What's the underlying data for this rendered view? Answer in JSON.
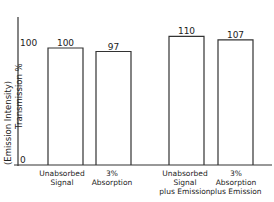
{
  "chart_data": {
    "type": "bar",
    "title": "",
    "xlabel": "",
    "ylabel": "Transmission %",
    "ylabel2": "(Emission Intensity)",
    "ylim": [
      0,
      115
    ],
    "yticks": [
      0,
      100
    ],
    "categories": [
      [
        "Unabsorbed",
        "Signal"
      ],
      [
        "3%",
        "Absorption"
      ],
      [
        "Unabsorbed",
        "Signal",
        "plus Emission"
      ],
      [
        "3%",
        "Absorption",
        "plus Emission"
      ]
    ],
    "values": [
      100,
      97,
      110,
      107
    ],
    "data_labels": [
      "100",
      "97",
      "110",
      "107"
    ],
    "grid": false,
    "legend": null
  },
  "axis": {
    "tick_0": "0",
    "tick_100": "100",
    "ylabel_line1": "(Emission Intensity)",
    "ylabel_line2": "Transmission %"
  }
}
